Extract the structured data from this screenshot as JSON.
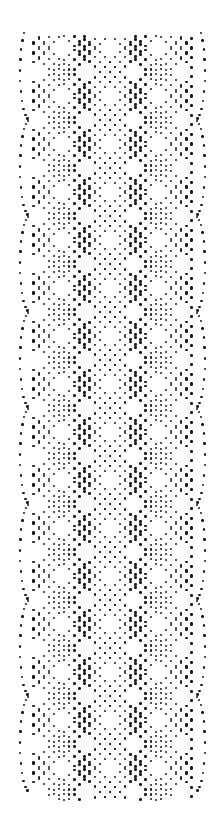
{
  "image": {
    "subject": "dot-to-dot celtic braid pattern",
    "width": 221,
    "height": 815,
    "background": "#ffffff",
    "dot_color": "#1a1a1a"
  },
  "pattern": {
    "period": 96,
    "first_crossing_y": 120,
    "last_y": 790,
    "top_start_y": 40,
    "left_arc_x": 20,
    "right_arc_x": 205,
    "center_x": 110,
    "lattice_left": 30,
    "lattice_right": 195,
    "dot_step": 7.2,
    "band_offsets": [
      -7,
      0,
      7
    ]
  }
}
